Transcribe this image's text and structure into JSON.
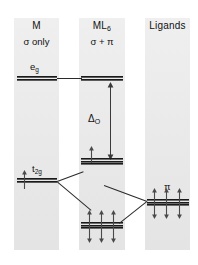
{
  "diagram": {
    "type": "molecular-orbital-energy-level-diagram",
    "background": "#ffffff",
    "panel_color": "#ececec",
    "level_color": "#1a1a1a",
    "columns": [
      {
        "id": "metal",
        "title": "M",
        "subtitle_pre": "σ only",
        "subtitle_sigma": "σ",
        "subtitle_rest": "only"
      },
      {
        "id": "complex",
        "title_main": "ML",
        "title_sub": "6",
        "subtitle": "σ + π"
      },
      {
        "id": "ligands",
        "title": "Ligands"
      }
    ],
    "labels": {
      "eg_main": "e",
      "eg_sub": "g",
      "t2g_main": "t",
      "t2g_sub": "2g",
      "delta_main": "Δ",
      "delta_sub": "O",
      "pi": "π"
    },
    "levels": [
      {
        "name": "metal-eg-level",
        "column": "metal",
        "label": "e_g",
        "degeneracy": 2,
        "electrons_up": 0,
        "electrons_down": 0,
        "energy_rank": "high"
      },
      {
        "name": "metal-t2g-level",
        "column": "metal",
        "label": "t_2g",
        "degeneracy": 3,
        "electrons_up": 1,
        "electrons_down": 0,
        "energy_rank": "mid"
      },
      {
        "name": "complex-eg-antibonding-level",
        "column": "complex",
        "label": "e_g*",
        "degeneracy": 2,
        "electrons_up": 0,
        "electrons_down": 0,
        "energy_rank": "high"
      },
      {
        "name": "complex-t2g-antibonding-level",
        "column": "complex",
        "label": "t_2g*",
        "degeneracy": 3,
        "electrons_up": 1,
        "electrons_down": 0,
        "energy_rank": "mid"
      },
      {
        "name": "complex-pi-bonding-level",
        "column": "complex",
        "label": "t_2g bonding",
        "degeneracy": 3,
        "electrons_up": 3,
        "electrons_down": 3,
        "energy_rank": "low"
      },
      {
        "name": "ligand-pi-level",
        "column": "ligands",
        "label": "π",
        "degeneracy": 3,
        "electrons_up": 3,
        "electrons_down": 3,
        "energy_rank": "low-mid"
      }
    ],
    "splitting": {
      "name": "octahedral-splitting",
      "symbol": "Δ",
      "subscript": "O",
      "between": [
        "complex-t2g-antibonding-level",
        "complex-eg-antibonding-level"
      ],
      "arrow_style": "double-headed-vertical"
    },
    "correlation_lines": [
      {
        "from": "metal-eg-level",
        "to": "complex-eg-antibonding-level"
      },
      {
        "from": "metal-t2g-level",
        "to": "complex-t2g-antibonding-level"
      },
      {
        "from": "metal-t2g-level",
        "to": "complex-pi-bonding-level"
      },
      {
        "from": "ligand-pi-level",
        "to": "complex-t2g-antibonding-level"
      },
      {
        "from": "ligand-pi-level",
        "to": "complex-pi-bonding-level"
      }
    ]
  }
}
